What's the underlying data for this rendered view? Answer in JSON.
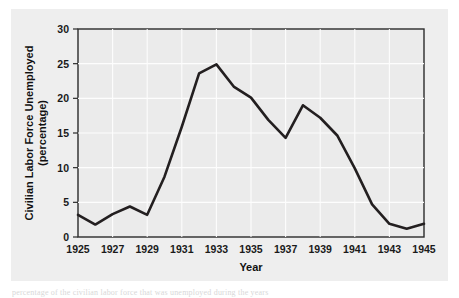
{
  "figure": {
    "background_color": "#eeeeee",
    "plot_background_color": "#ebebeb",
    "line_color": "#231f20",
    "grid_color": "#fdfdfd",
    "axis_color": "#2b2b2b",
    "caption_fragment": "percentage of the civilian labor force that was unemployed during the years"
  },
  "chart_data": {
    "type": "line",
    "title": "",
    "xlabel": "Year",
    "ylabel": "Civilian Labor Force Unemployed (percentage)",
    "ylabel_line1": "Civilian Labor Force Unemployed",
    "ylabel_line2": "(percentage)",
    "xlim": [
      1925,
      1945
    ],
    "ylim": [
      0,
      30
    ],
    "yticks": [
      0,
      5,
      10,
      15,
      20,
      25,
      30
    ],
    "ytick_labels": [
      "0",
      "5",
      "10",
      "15",
      "20",
      "25",
      "30"
    ],
    "xticks": [
      1925,
      1927,
      1929,
      1931,
      1933,
      1935,
      1937,
      1939,
      1941,
      1943,
      1945
    ],
    "xtick_labels": [
      "1925",
      "1927",
      "1929",
      "1931",
      "1933",
      "1935",
      "1937",
      "1939",
      "1941",
      "1943",
      "1945"
    ],
    "x_minor_step": 1,
    "grid": true,
    "legend": false,
    "x": [
      1925,
      1926,
      1927,
      1928,
      1929,
      1930,
      1931,
      1932,
      1933,
      1934,
      1935,
      1936,
      1937,
      1938,
      1939,
      1940,
      1941,
      1942,
      1943,
      1944,
      1945
    ],
    "values": [
      3.2,
      1.8,
      3.3,
      4.4,
      3.2,
      8.7,
      15.9,
      23.6,
      24.9,
      21.7,
      20.1,
      16.9,
      14.3,
      19.0,
      17.2,
      14.6,
      9.9,
      4.7,
      1.9,
      1.2,
      1.9
    ],
    "series": [
      {
        "name": "Civilian Labor Force Unemployed",
        "values": [
          3.2,
          1.8,
          3.3,
          4.4,
          3.2,
          8.7,
          15.9,
          23.6,
          24.9,
          21.7,
          20.1,
          16.9,
          14.3,
          19.0,
          17.2,
          14.6,
          9.9,
          4.7,
          1.9,
          1.2,
          1.9
        ]
      }
    ]
  }
}
